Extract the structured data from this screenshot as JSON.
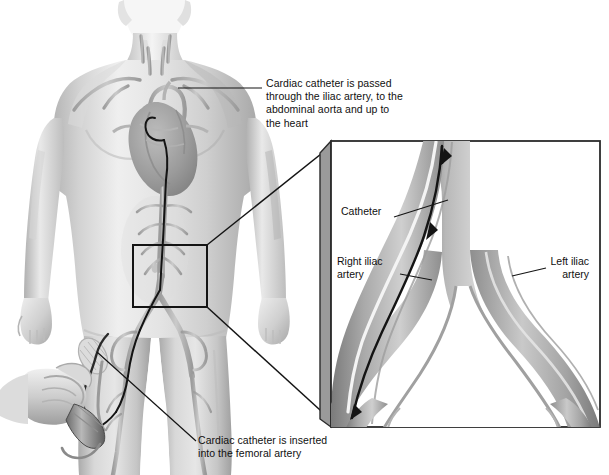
{
  "figure": {
    "type": "medical-illustration",
    "palette": {
      "body_fill": "#c9c9c9",
      "body_light": "#ededed",
      "body_shadow": "#a3a3a3",
      "vessel_fill": "#b0b0b0",
      "vessel_dark": "#8a8a8a",
      "vessel_light": "#e8e8e8",
      "catheter": "#141414",
      "line": "#1a1a1a",
      "panel_frame": "#2b2b2b",
      "panel_bevel": "#8f8f8f",
      "background": "#ffffff",
      "text": "#101010"
    }
  },
  "callouts": {
    "heart": {
      "text": "Cardiac catheter is passed\nthrough the iliac artery, to the\nabdominal aorta and up to\nthe heart",
      "x": 266,
      "y": 77
    },
    "femoral": {
      "text": "Cardiac catheter is inserted\ninto the femoral artery",
      "x": 198,
      "y": 440
    }
  },
  "inset": {
    "labels": {
      "catheter": "Catheter",
      "right_iliac": "Right iliac\nartery",
      "left_iliac": "Left iliac\nartery"
    }
  }
}
